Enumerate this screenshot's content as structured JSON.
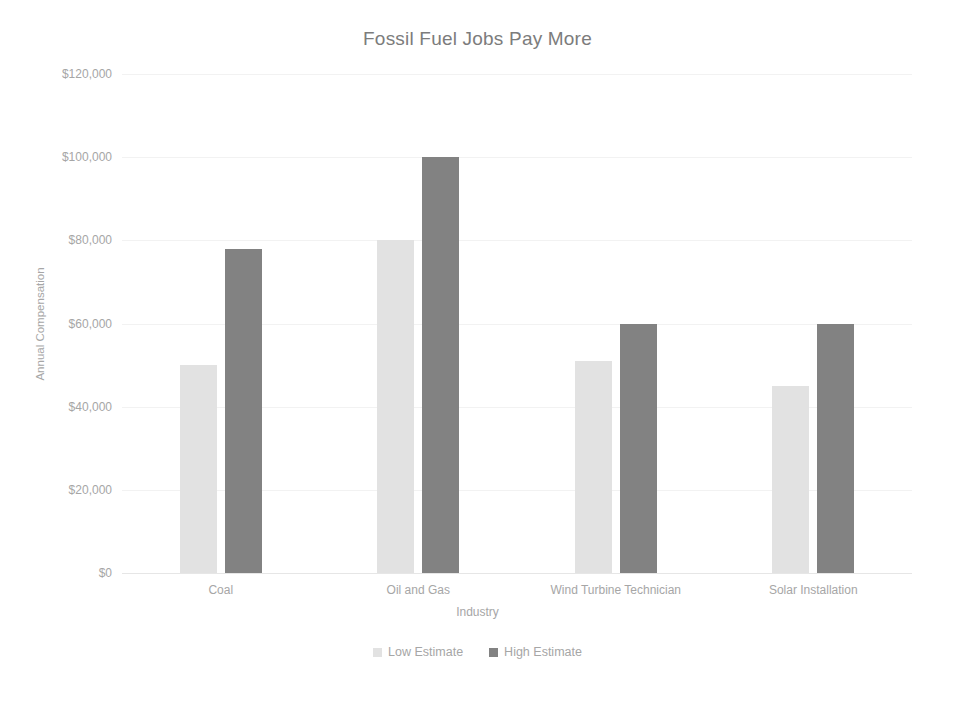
{
  "chart_data": {
    "type": "bar",
    "title": "Fossil Fuel Jobs Pay More",
    "xlabel": "Industry",
    "ylabel": "Annual Compensation",
    "categories": [
      "Coal",
      "Oil and Gas",
      "Wind Turbine Technician",
      "Solar Installation"
    ],
    "series": [
      {
        "name": "Low Estimate",
        "color": "#e2e2e2",
        "values": [
          50000,
          80000,
          51000,
          45000
        ]
      },
      {
        "name": "High Estimate",
        "color": "#828282",
        "values": [
          78000,
          100000,
          60000,
          60000
        ]
      }
    ],
    "ylim": [
      0,
      120000
    ],
    "ytick_values": [
      120000,
      100000,
      80000,
      60000,
      40000,
      20000,
      0
    ],
    "ytick_labels": [
      "$120,000",
      "$100,000",
      "$80,000",
      "$60,000",
      "$40,000",
      "$20,000",
      "$0"
    ],
    "grid": true,
    "grid_axis": "y",
    "legend_position": "bottom",
    "background_color": "#ffffff",
    "text_color": "#a6a6a6",
    "title_color": "#7c7c7c"
  }
}
